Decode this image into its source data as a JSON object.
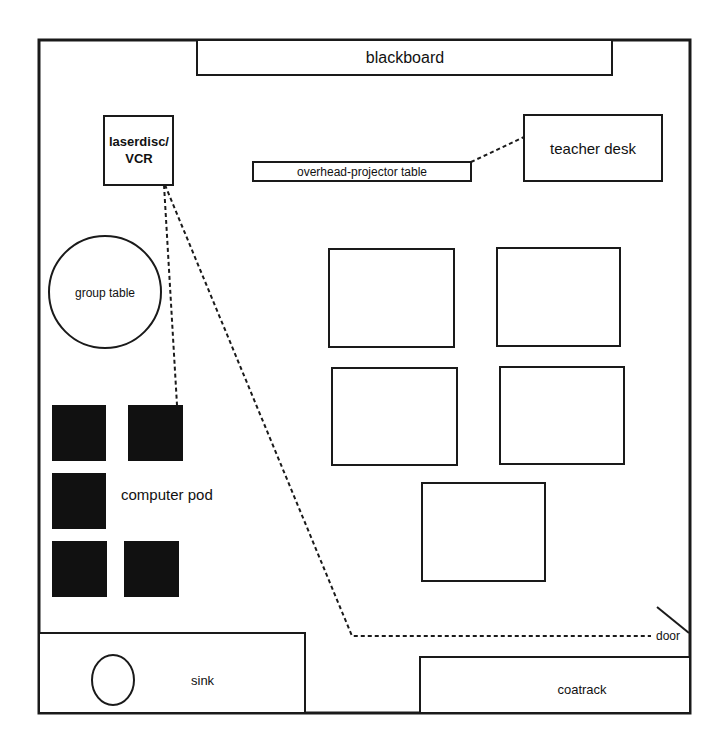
{
  "diagram": {
    "type": "classroom-floor-plan",
    "colors": {
      "line": "#1a1a1a",
      "fill_dark": "#111111",
      "background": "#ffffff"
    },
    "labels": {
      "blackboard": "blackboard",
      "laserdisc_line1": "laserdisc/",
      "laserdisc_line2": "VCR",
      "overhead_projector_table": "overhead-projector table",
      "teacher_desk": "teacher desk",
      "group_table": "group table",
      "computer_pod": "computer pod",
      "sink": "sink",
      "coatrack": "coatrack",
      "door": "door"
    },
    "student_desks": [
      {
        "id": "desk-1"
      },
      {
        "id": "desk-2"
      },
      {
        "id": "desk-3"
      },
      {
        "id": "desk-4"
      },
      {
        "id": "desk-5"
      }
    ],
    "computers": [
      {
        "id": "computer-1"
      },
      {
        "id": "computer-2"
      },
      {
        "id": "computer-3"
      },
      {
        "id": "computer-4"
      },
      {
        "id": "computer-5"
      }
    ],
    "connections": [
      {
        "from": "laserdisc/VCR",
        "to": "computer pod",
        "style": "dashed"
      },
      {
        "from": "laserdisc/VCR",
        "to": "door",
        "style": "dashed"
      },
      {
        "from": "overhead-projector table",
        "to": "teacher desk",
        "style": "dashed"
      }
    ]
  }
}
